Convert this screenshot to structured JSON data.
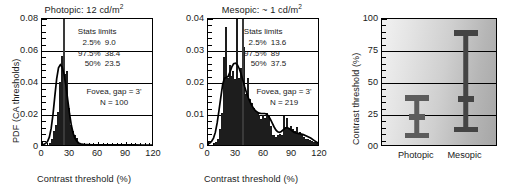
{
  "figure": {
    "panels": [
      "photopic-histogram",
      "mesopic-histogram",
      "summary-errorbars"
    ]
  },
  "chart_data": [
    {
      "type": "bar",
      "id": "photopic",
      "title": "Photopic: 12 cd/m",
      "title_sup": "2",
      "xlabel": "Contrast threshold (%)",
      "ylabel": "PDF (CA thresholds)",
      "xlim": [
        0,
        120
      ],
      "ylim": [
        0,
        0.08
      ],
      "xticks": [
        "0",
        "30",
        "60",
        "90",
        "120"
      ],
      "xtick_values": [
        0,
        30,
        60,
        90,
        120
      ],
      "yticks": [
        "0",
        "0.02",
        "0.04",
        "0.06",
        "0.08"
      ],
      "ytick_values": [
        0,
        0.02,
        0.04,
        0.06,
        0.08
      ],
      "grid": true,
      "bin_width": 2,
      "bin_centers": [
        1,
        3,
        5,
        7,
        9,
        11,
        13,
        15,
        17,
        19,
        21,
        23,
        25,
        27,
        29,
        31,
        33,
        35,
        37,
        39,
        41,
        43,
        45,
        47,
        49,
        51,
        53,
        55,
        57,
        59,
        61,
        63,
        65,
        67,
        69,
        71,
        73,
        75,
        77,
        79,
        81,
        83,
        85,
        87,
        89,
        91,
        93,
        95,
        97,
        99,
        101,
        103,
        105,
        107,
        109,
        111,
        113,
        115,
        117,
        119
      ],
      "values": [
        0,
        0,
        0,
        0,
        0.0015,
        0.0035,
        0.0085,
        0.0125,
        0.0205,
        0.0395,
        0.0555,
        0.08,
        0.0445,
        0.0465,
        0.023,
        0.0125,
        0.0085,
        0.0065,
        0.0045,
        0.0015,
        0.001,
        0.0008,
        0.0005,
        0.0004,
        0.0003,
        0.0002,
        0.0002,
        0.0002,
        0.0001,
        0.0001,
        0.0001,
        0.0001,
        0.0001,
        0.0001,
        0.0001,
        0,
        0,
        0,
        0.0001,
        0,
        0,
        0,
        0.0001,
        0,
        0,
        0,
        0,
        0,
        0,
        0,
        0,
        0,
        0,
        0,
        0,
        0,
        0,
        0,
        0,
        0
      ],
      "fit_curve": {
        "name": "kernel density fit",
        "x": [
          0,
          2,
          4,
          6,
          8,
          10,
          12,
          14,
          16,
          18,
          20,
          22,
          24,
          26,
          28,
          30,
          32,
          34,
          36,
          38,
          40,
          42,
          44,
          46,
          48,
          50,
          55,
          60,
          70,
          80,
          90,
          100,
          110,
          120
        ],
        "y": [
          0.0002,
          0.0004,
          0.001,
          0.0022,
          0.005,
          0.0105,
          0.0195,
          0.031,
          0.042,
          0.049,
          0.051,
          0.0495,
          0.045,
          0.038,
          0.029,
          0.02,
          0.0125,
          0.0075,
          0.0042,
          0.0024,
          0.0013,
          0.0008,
          0.0005,
          0.0003,
          0.0002,
          0.0002,
          0.0001,
          0.0001,
          0.0001,
          0.0001,
          0.0001,
          0.0001,
          0,
          0
        ]
      },
      "median_line_x": 23.5,
      "stats": {
        "header": "Stats limits",
        "rows": [
          {
            "pct": "2.5%",
            "value": "9.0"
          },
          {
            "pct": "97.5%",
            "value": "38.4"
          },
          {
            "pct": "50%",
            "value": "23.5"
          }
        ]
      },
      "notes": [
        "Fovea, gap = 3'",
        "N = 100"
      ]
    },
    {
      "type": "bar",
      "id": "mesopic",
      "title": "Mesopic: ~ 1 cd/m",
      "title_sup": "2",
      "xlabel": "Contrast threshold (%)",
      "ylabel": "",
      "xlim": [
        0,
        120
      ],
      "ylim": [
        0,
        0.04
      ],
      "xticks": [
        "0",
        "30",
        "60",
        "90",
        "120"
      ],
      "xtick_values": [
        0,
        30,
        60,
        90,
        120
      ],
      "yticks": [
        "0",
        "0.01",
        "0.02",
        "0.03",
        "0.04"
      ],
      "ytick_values": [
        0,
        0.01,
        0.02,
        0.03,
        0.04
      ],
      "grid": true,
      "bin_width": 2,
      "bin_centers": [
        1,
        3,
        5,
        7,
        9,
        11,
        13,
        15,
        17,
        19,
        21,
        23,
        25,
        27,
        29,
        31,
        33,
        35,
        37,
        39,
        41,
        43,
        45,
        47,
        49,
        51,
        53,
        55,
        57,
        59,
        61,
        63,
        65,
        67,
        69,
        71,
        73,
        75,
        77,
        79,
        81,
        83,
        85,
        87,
        89,
        91,
        93,
        95,
        97,
        99,
        101,
        103,
        105,
        107,
        109,
        111,
        113,
        115,
        117,
        119
      ],
      "values": [
        0,
        0,
        0,
        0.0006,
        0.001,
        0.0018,
        0.005,
        0.01,
        0.0275,
        0.037,
        0.021,
        0.025,
        0.0215,
        0.023,
        0.0205,
        0.04,
        0.021,
        0.024,
        0.0185,
        0.0305,
        0.016,
        0.021,
        0.0145,
        0.013,
        0.0115,
        0.0105,
        0.01,
        0.0095,
        0.008,
        0.0095,
        0.0085,
        0.01,
        0.0095,
        0.006,
        0.003,
        0.003,
        0.0025,
        0.003,
        0.0035,
        0.003,
        0.009,
        0.0055,
        0.0085,
        0.005,
        0.006,
        0.005,
        0.0045,
        0.0055,
        0.0035,
        0.004,
        0.003,
        0.0025,
        0.002,
        0.0018,
        0.0015,
        0.0012,
        0.001,
        0.0008,
        0.0006,
        0.0005
      ],
      "fit_curve": {
        "name": "kernel density fit",
        "x": [
          0,
          2,
          4,
          6,
          8,
          10,
          12,
          14,
          16,
          18,
          20,
          22,
          24,
          26,
          28,
          30,
          32,
          34,
          36,
          38,
          40,
          42,
          44,
          46,
          48,
          50,
          52,
          54,
          56,
          58,
          60,
          62,
          64,
          66,
          68,
          70,
          72,
          74,
          76,
          78,
          80,
          82,
          84,
          86,
          88,
          90,
          92,
          94,
          96,
          98,
          100,
          104,
          108,
          112,
          116,
          120
        ],
        "y": [
          0.0003,
          0.0006,
          0.0012,
          0.0022,
          0.004,
          0.007,
          0.011,
          0.0152,
          0.0192,
          0.0212,
          0.0214,
          0.0218,
          0.0232,
          0.0248,
          0.0258,
          0.026,
          0.0255,
          0.0243,
          0.0226,
          0.0206,
          0.0185,
          0.0166,
          0.015,
          0.0136,
          0.0124,
          0.0115,
          0.0108,
          0.0104,
          0.0101,
          0.01,
          0.01,
          0.01,
          0.0098,
          0.0092,
          0.0082,
          0.007,
          0.0058,
          0.0048,
          0.0042,
          0.004,
          0.0043,
          0.0048,
          0.0053,
          0.0055,
          0.0053,
          0.0049,
          0.0044,
          0.004,
          0.0038,
          0.0037,
          0.0036,
          0.0033,
          0.0028,
          0.0022,
          0.0014,
          0.0006
        ]
      },
      "median_line_x": 37.5,
      "stats": {
        "header": "Stats limits",
        "rows": [
          {
            "pct": "2.5%",
            "value": "13.6"
          },
          {
            "pct": "97.5%",
            "value": "89"
          },
          {
            "pct": "50%",
            "value": "37.5"
          }
        ]
      },
      "notes": [
        "Fovea, gap = 3'",
        "N = 219"
      ]
    },
    {
      "type": "errorbar",
      "id": "summary",
      "title": "",
      "xlabel": "",
      "ylabel": "Contrast threshold (%)",
      "ylim": [
        0,
        100
      ],
      "yticks": [
        "00",
        "25",
        "50",
        "75",
        "100"
      ],
      "ytick_values": [
        0,
        25,
        50,
        75,
        100
      ],
      "grid": true,
      "categories": [
        "Photopic",
        "Mesopic"
      ],
      "series": [
        {
          "name": "Photopic",
          "median": 23.5,
          "low": 9.0,
          "high": 38.4
        },
        {
          "name": "Mesopic",
          "median": 37.5,
          "low": 13.6,
          "high": 89.0
        }
      ],
      "background": "gradient-light-to-dark"
    }
  ],
  "colors": {
    "axis": "#000000",
    "bar_fill": "#4a4a4a",
    "curve": "#000000",
    "errorbar_photopic": "#5c5c5c",
    "errorbar_mesopic": "#444444",
    "background": "#ffffff"
  }
}
